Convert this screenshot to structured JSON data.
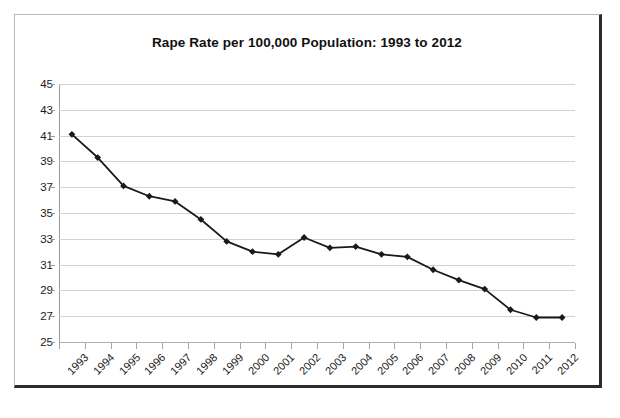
{
  "chart_data": {
    "type": "line",
    "title": "Rape Rate per 100,000 Population: 1993 to 2012",
    "xlabel": "",
    "ylabel": "",
    "categories": [
      "1993",
      "1994",
      "1995",
      "1996",
      "1997",
      "1998",
      "1999",
      "2000",
      "2001",
      "2002",
      "2003",
      "2004",
      "2005",
      "2006",
      "2007",
      "2008",
      "2009",
      "2010",
      "2011",
      "2012"
    ],
    "values": [
      41.1,
      39.3,
      37.1,
      36.3,
      35.9,
      34.5,
      32.8,
      32.0,
      31.8,
      33.1,
      32.3,
      32.4,
      31.8,
      31.6,
      30.6,
      29.8,
      29.1,
      27.5,
      26.9,
      26.9
    ],
    "ylim": [
      25,
      45
    ],
    "ytick_step": 2,
    "yticks": [
      45,
      43,
      41,
      39,
      37,
      35,
      33,
      31,
      29,
      27,
      25
    ],
    "grid": "horizontal",
    "legend": "none",
    "marker": "diamond",
    "series_color": "#1a1a1a",
    "gridline_color": "#d2d2d2",
    "background_color": "#ffffff",
    "border_color": "#2b2b2b"
  }
}
